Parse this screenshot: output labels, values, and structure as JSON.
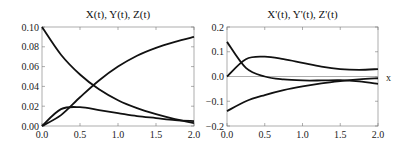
{
  "chart_data": [
    {
      "type": "line",
      "title": "X(t), Y(t), Z(t)",
      "xlabel": "",
      "ylabel": "",
      "xlim": [
        0,
        2
      ],
      "ylim": [
        0,
        0.1
      ],
      "xticks": [
        "0.0",
        "0.5",
        "1.0",
        "1.5",
        "2.0"
      ],
      "yticks": [
        "0.00",
        "0.02",
        "0.04",
        "0.06",
        "0.08",
        "0.10"
      ],
      "grid": false,
      "legend": "none",
      "x": [
        0,
        0.25,
        0.5,
        0.75,
        1.0,
        1.25,
        1.5,
        1.75,
        2.0
      ],
      "series": [
        {
          "name": "X(t)",
          "values": [
            0.1,
            0.072,
            0.052,
            0.037,
            0.026,
            0.018,
            0.012,
            0.007,
            0.003
          ]
        },
        {
          "name": "Y(t)",
          "values": [
            0.0,
            0.017,
            0.019,
            0.016,
            0.013,
            0.01,
            0.008,
            0.006,
            0.005
          ]
        },
        {
          "name": "Z(t)",
          "values": [
            0.0,
            0.011,
            0.029,
            0.046,
            0.06,
            0.071,
            0.079,
            0.085,
            0.09
          ]
        }
      ]
    },
    {
      "type": "line",
      "title": "X'(t), Y'(t), Z'(t)",
      "xlabel": "x",
      "ylabel": "",
      "xlim": [
        0,
        2
      ],
      "ylim": [
        -0.2,
        0.2
      ],
      "xticks": [
        "0.0",
        "0.5",
        "1.0",
        "1.5",
        "2.0"
      ],
      "yticks": [
        "-0.2",
        "-0.1",
        "0.0",
        "0.1",
        "0.2"
      ],
      "grid": false,
      "legend": "none",
      "x": [
        0,
        0.25,
        0.5,
        0.75,
        1.0,
        1.25,
        1.5,
        1.75,
        2.0
      ],
      "series": [
        {
          "name": "X'(t)",
          "values": [
            -0.14,
            -0.1,
            -0.075,
            -0.055,
            -0.04,
            -0.028,
            -0.019,
            -0.012,
            -0.007
          ]
        },
        {
          "name": "Y'(t)",
          "values": [
            0.14,
            0.035,
            0.0,
            -0.012,
            -0.016,
            -0.016,
            -0.015,
            -0.02,
            -0.03
          ]
        },
        {
          "name": "Z'(t)",
          "values": [
            0.0,
            0.07,
            0.08,
            0.07,
            0.055,
            0.04,
            0.03,
            0.027,
            0.03
          ]
        }
      ]
    }
  ]
}
